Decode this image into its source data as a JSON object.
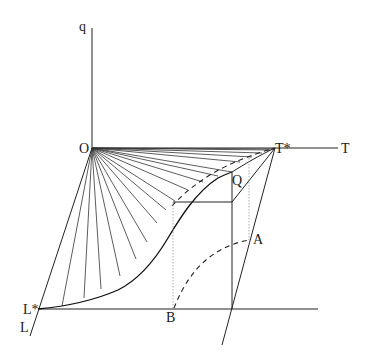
{
  "diagram": {
    "labels": {
      "q": "q",
      "O": "O",
      "T_star": "T*",
      "T": "T",
      "Q": "Q",
      "A": "A",
      "B": "B",
      "L_star": "L*",
      "L": "L"
    },
    "colors": {
      "line": "#222222",
      "background": "#ffffff",
      "dotted": "#999999"
    }
  }
}
